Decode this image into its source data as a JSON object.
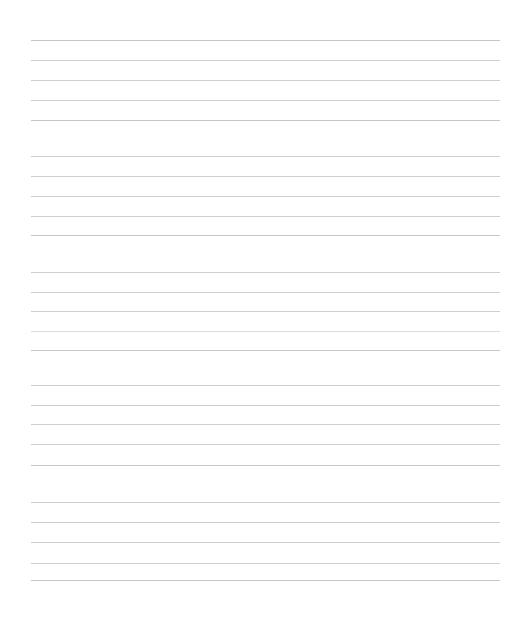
{
  "document": {
    "type": "ruled-notebook-page",
    "title": "Blank Ruled Page",
    "page_width": 505,
    "page_height": 626,
    "background_color": "#ffffff",
    "has_text_content": false,
    "content_text": ""
  },
  "ruling": {
    "line_color": "#cfcfcf",
    "line_color_faint": "#dcdcdc",
    "line_color_strong": "#c6c6c6",
    "line_thickness_px": 1,
    "line_left_x": 31,
    "line_right_x": 500,
    "line_width": 469,
    "default_spacing_px": 19.5,
    "section_gap_px": 36,
    "line_count": 29,
    "top_margin_px": 40,
    "bottom_margin_px": 46,
    "left_margin_px": 31,
    "right_margin_px": 5,
    "lines": [
      {
        "index": 1,
        "y": 40,
        "x": 31,
        "width": 469,
        "weight": "strong"
      },
      {
        "index": 2,
        "y": 60,
        "x": 31,
        "width": 469,
        "weight": "normal"
      },
      {
        "index": 3,
        "y": 80,
        "x": 31,
        "width": 469,
        "weight": "normal"
      },
      {
        "index": 4,
        "y": 100,
        "x": 31,
        "width": 469,
        "weight": "normal"
      },
      {
        "index": 5,
        "y": 120,
        "x": 31,
        "width": 469,
        "weight": "strong"
      },
      {
        "index": 6,
        "y": 156,
        "x": 31,
        "width": 469,
        "weight": "normal"
      },
      {
        "index": 7,
        "y": 176,
        "x": 31,
        "width": 469,
        "weight": "normal"
      },
      {
        "index": 8,
        "y": 196,
        "x": 31,
        "width": 469,
        "weight": "normal"
      },
      {
        "index": 9,
        "y": 216,
        "x": 31,
        "width": 469,
        "weight": "normal"
      },
      {
        "index": 10,
        "y": 235,
        "x": 31,
        "width": 469,
        "weight": "strong"
      },
      {
        "index": 11,
        "y": 272,
        "x": 31,
        "width": 469,
        "weight": "normal"
      },
      {
        "index": 12,
        "y": 292,
        "x": 31,
        "width": 469,
        "weight": "normal"
      },
      {
        "index": 13,
        "y": 311,
        "x": 31,
        "width": 469,
        "weight": "normal"
      },
      {
        "index": 14,
        "y": 331,
        "x": 31,
        "width": 469,
        "weight": "faint"
      },
      {
        "index": 15,
        "y": 350,
        "x": 31,
        "width": 469,
        "weight": "strong"
      },
      {
        "index": 16,
        "y": 385,
        "x": 31,
        "width": 469,
        "weight": "normal"
      },
      {
        "index": 17,
        "y": 405,
        "x": 31,
        "width": 469,
        "weight": "normal"
      },
      {
        "index": 18,
        "y": 424,
        "x": 31,
        "width": 469,
        "weight": "normal"
      },
      {
        "index": 19,
        "y": 444,
        "x": 31,
        "width": 469,
        "weight": "normal"
      },
      {
        "index": 20,
        "y": 465,
        "x": 31,
        "width": 469,
        "weight": "strong"
      },
      {
        "index": 21,
        "y": 502,
        "x": 31,
        "width": 469,
        "weight": "normal"
      },
      {
        "index": 22,
        "y": 522,
        "x": 31,
        "width": 469,
        "weight": "normal"
      },
      {
        "index": 23,
        "y": 542,
        "x": 31,
        "width": 469,
        "weight": "normal"
      },
      {
        "index": 24,
        "y": 563,
        "x": 31,
        "width": 469,
        "weight": "normal"
      },
      {
        "index": 25,
        "y": 580,
        "x": 31,
        "width": 469,
        "weight": "strong"
      }
    ]
  }
}
